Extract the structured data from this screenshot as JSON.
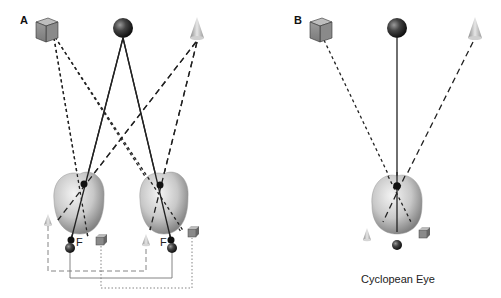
{
  "panels": {
    "a": {
      "label": "A"
    },
    "b": {
      "label": "B",
      "caption": "Cyclopean Eye"
    }
  },
  "labels": {
    "fovea_left": "F",
    "fovea_right": "F"
  },
  "diagram": {
    "objects": [
      "cube",
      "sphere",
      "cone"
    ],
    "line_styles": {
      "cube": "dotted",
      "sphere": "solid",
      "cone": "dashed"
    }
  }
}
